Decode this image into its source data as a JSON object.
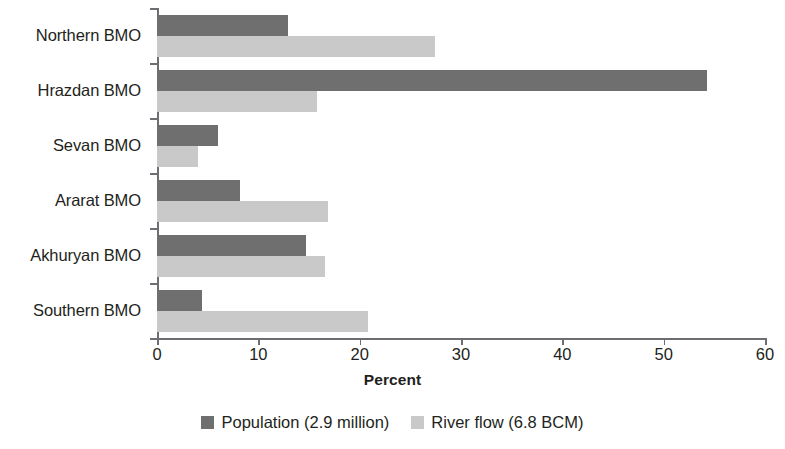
{
  "chart_data": {
    "type": "bar",
    "orientation": "horizontal",
    "title": "",
    "xlabel": "Percent",
    "ylabel": "",
    "xlim": [
      0,
      60
    ],
    "xticks": [
      0,
      10,
      20,
      30,
      40,
      50,
      60
    ],
    "xtick_labels": [
      "0",
      "10",
      "20",
      "30",
      "40",
      "50",
      "60"
    ],
    "grid": false,
    "legend_position": "bottom",
    "categories": [
      "Northern BMO",
      "Hrazdan BMO",
      "Sevan BMO",
      "Ararat BMO",
      "Akhuryan BMO",
      "Southern BMO"
    ],
    "series": [
      {
        "name": "Population (2.9 million)",
        "color": "#6f6f6f",
        "values": [
          12.9,
          54.3,
          6.0,
          8.2,
          14.7,
          4.4
        ]
      },
      {
        "name": "River flow (6.8 BCM)",
        "color": "#c9c9c9",
        "values": [
          27.4,
          15.8,
          4.0,
          16.9,
          16.6,
          20.8
        ]
      }
    ]
  },
  "axis": {
    "x_title": "Percent"
  },
  "legend": {
    "items": [
      {
        "label": "Population (2.9 million)",
        "swatch": "#6f6f6f"
      },
      {
        "label": "River flow (6.8 BCM)",
        "swatch": "#c9c9c9"
      }
    ]
  }
}
